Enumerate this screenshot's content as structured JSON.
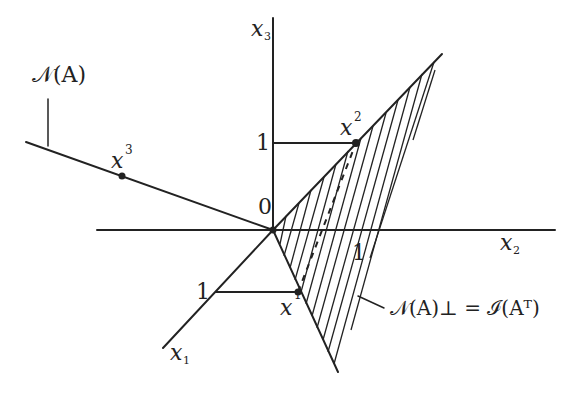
{
  "diagram": {
    "axes": {
      "x1_label": "x",
      "x1_sub": "1",
      "x2_label": "x",
      "x2_sub": "2",
      "x3_label": "x",
      "x3_sub": "3",
      "origin_label": "0"
    },
    "ticks": {
      "x1_tick": "1",
      "x2_tick": "1",
      "x3_tick": "1"
    },
    "points": {
      "x1": {
        "label": "x",
        "sup": "1"
      },
      "x2": {
        "label": "x",
        "sup": "2"
      },
      "x3": {
        "label": "x",
        "sup": "3"
      }
    },
    "labels": {
      "null_space": "𝒩(A)",
      "orth_complement": "𝒩(A)⊥ = ℐ(Aᵀ)"
    },
    "colors": {
      "ink": "#222222",
      "background": "#ffffff"
    }
  }
}
